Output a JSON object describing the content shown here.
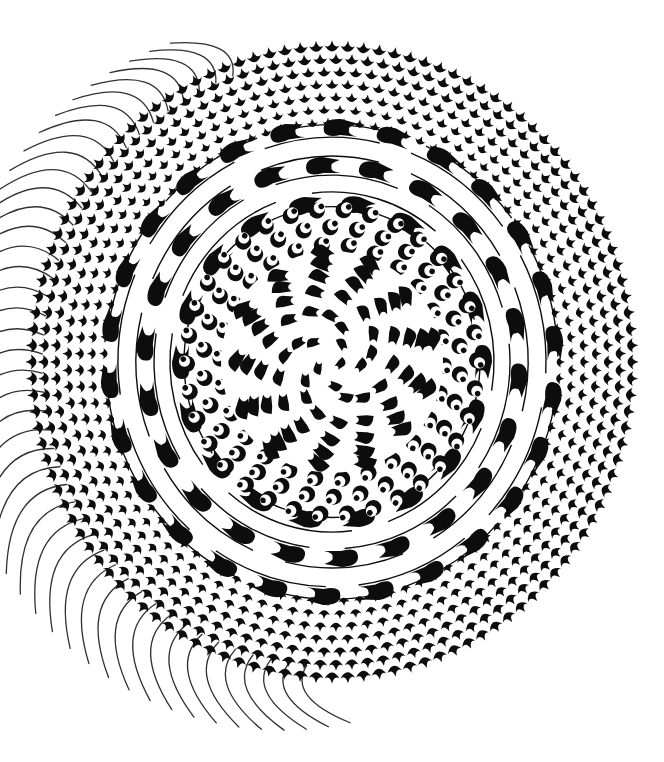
{
  "artwork": {
    "kind": "abstract-generative-marbling",
    "background": "#ffffff",
    "ink": "#0d0d0d",
    "center": {
      "x": 332,
      "y": 362
    },
    "outer_scales": {
      "r_inner": 228,
      "r_outer": 300,
      "rows": 7,
      "count": 120,
      "size": 7
    },
    "fringe": {
      "from_deg": 95,
      "to_deg": 250,
      "count": 44,
      "length_min": 20,
      "length_max": 95,
      "base_r": 290,
      "bend": 0.35
    },
    "middle_hooks": {
      "r_inner": 150,
      "r_outer": 222,
      "rows": 3,
      "count": 26,
      "len": 34,
      "thick": 10
    },
    "arcs": {
      "radii": [
        148,
        162,
        178,
        196,
        214,
        226
      ],
      "stroke": 1.4
    },
    "inner_crescents": {
      "r_inner": 95,
      "r_outer": 145,
      "rows": 4,
      "count": 34,
      "size": 8
    },
    "core": {
      "r_max": 105,
      "count": 70,
      "len": 18,
      "thick": 12,
      "swirl": 2.4
    }
  }
}
